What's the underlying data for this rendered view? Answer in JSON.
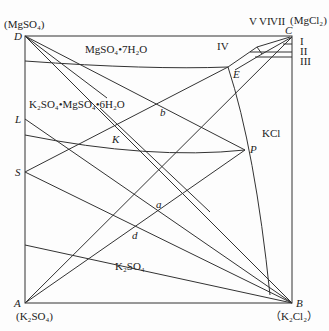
{
  "diagram": {
    "type": "phase-diagram",
    "corners": {
      "D": {
        "label": "D",
        "compound": "(MgSO₄)"
      },
      "C": {
        "label": "C",
        "compound": "(MgCl₂)"
      },
      "A": {
        "label": "A",
        "compound": "(K₂SO₄)"
      },
      "B": {
        "label": "B",
        "compound": "（K₂Cl₂）"
      }
    },
    "points": {
      "E": "E",
      "P": "P",
      "L": "L",
      "S": "S",
      "K": "K",
      "b": "b",
      "a": "a",
      "d": "d"
    },
    "regions": {
      "r1": "MgSO₄•7H₂O",
      "r2": "K₂SO₄•MgSO₄•6H₂O",
      "r3": "KCl",
      "r4": "K₂SO₄"
    },
    "small_regions": {
      "I": "I",
      "II": "II",
      "III": "III",
      "IV": "IV",
      "V": "V",
      "VI": "VI",
      "VII": "VII"
    }
  }
}
